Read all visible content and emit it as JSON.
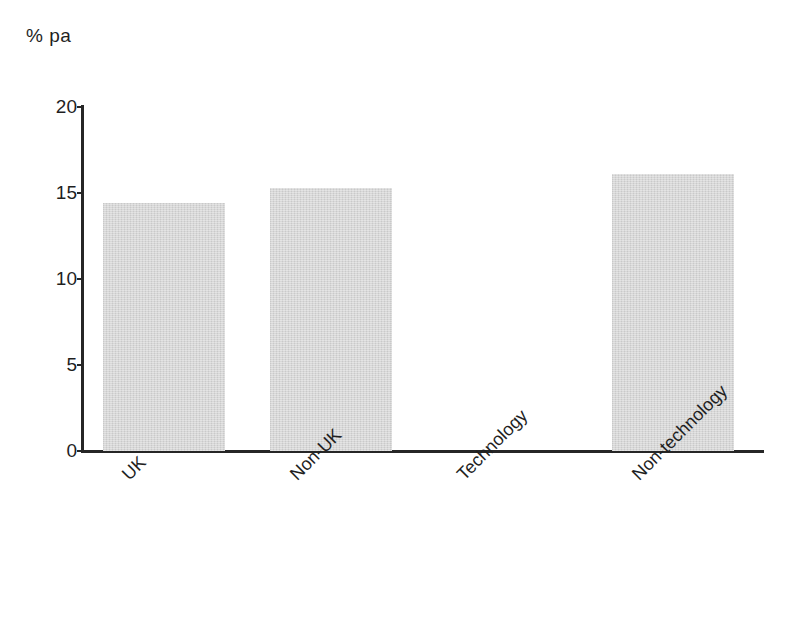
{
  "chart_data": {
    "type": "bar",
    "title": "",
    "subtitle": "",
    "xlabel": "",
    "ylabel": "% pa",
    "unit_label": "% pa",
    "categories": [
      "UK",
      "Non-UK",
      "Technology",
      "Non-technology"
    ],
    "values": [
      14.4,
      15.3,
      null,
      16.1
    ],
    "series": [
      {
        "name": "",
        "values": [
          14.4,
          15.3,
          null,
          16.1
        ]
      }
    ],
    "ylim": [
      0,
      20
    ],
    "yticks": [
      0,
      5,
      10,
      15,
      20
    ],
    "ytick_labels": [
      "0",
      "5",
      "10",
      "15",
      "20"
    ],
    "grid": false,
    "legend": false,
    "legend_position": "none",
    "bar_color": "#d5d5d5",
    "axis_color": "#262626",
    "text_color": "#1f1f1f",
    "background_color": "#ffffff",
    "label_rotation_degrees": -45
  }
}
